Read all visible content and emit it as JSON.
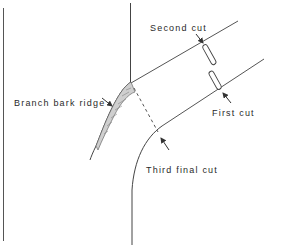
{
  "diagram": {
    "labels": {
      "second_cut": "Second cut",
      "first_cut": "First cut",
      "third_cut": "Third final cut",
      "branch_bark_ridge": "Branch bark ridge"
    },
    "colors": {
      "line": "#4a4a4a",
      "text": "#2a2a2a",
      "background": "#ffffff"
    }
  }
}
